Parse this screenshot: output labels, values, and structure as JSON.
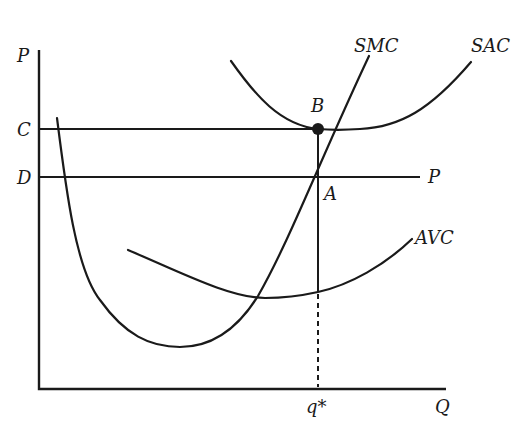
{
  "diagram": {
    "type": "economics cost curves (short-run firm)",
    "axes": {
      "y_label": "P",
      "x_label": "Q"
    },
    "price_labels": {
      "c": "C",
      "d": "D"
    },
    "price_line_label": "P",
    "curves": {
      "smc": "SMC",
      "sac": "SAC",
      "avc": "AVC"
    },
    "points": {
      "b": "B",
      "a": "A"
    },
    "quantity_label": "q*",
    "colors": {
      "ink": "#1a1a1a",
      "background": "#ffffff"
    }
  }
}
